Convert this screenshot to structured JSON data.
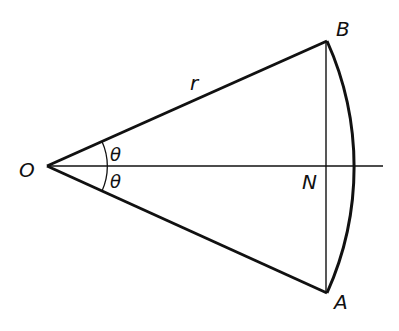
{
  "diagram": {
    "type": "circular sector geometry",
    "colors": {
      "stroke": "#111111",
      "background": "#ffffff"
    },
    "points": {
      "O": {
        "label": "O",
        "x": 47,
        "y": 166
      },
      "B": {
        "label": "B",
        "x": 327,
        "y": 41
      },
      "A": {
        "label": "A",
        "x": 327,
        "y": 293
      },
      "N": {
        "label": "N",
        "x": 327,
        "y": 166
      }
    },
    "labels": {
      "O": "O",
      "B": "B",
      "A": "A",
      "N": "N",
      "radius": "r",
      "angle_upper": "θ",
      "angle_lower": "θ"
    },
    "segments": [
      {
        "name": "OB",
        "from": "O",
        "to": "B",
        "label": "r"
      },
      {
        "name": "OA",
        "from": "O",
        "to": "A"
      },
      {
        "name": "BA-chord",
        "from": "B",
        "to": "A"
      },
      {
        "name": "axis",
        "from": "O",
        "to_x": 383
      }
    ],
    "arcs": [
      {
        "name": "arc-AB",
        "center": "O",
        "from": "B",
        "to": "A",
        "radius": 306.6
      },
      {
        "name": "angle-marker",
        "center": "O",
        "radius": 60,
        "spans": "2θ"
      }
    ]
  }
}
